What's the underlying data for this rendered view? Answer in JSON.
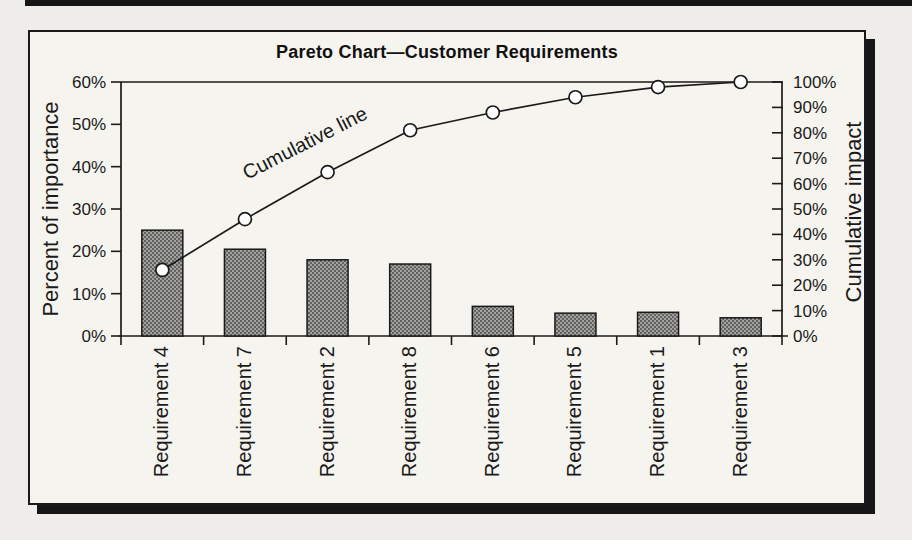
{
  "page": {
    "background": "#efede9",
    "canvas_background": "#f6f4ef",
    "rule_color": "#161616",
    "ink": "#1a1a1a",
    "bar_fill_tone": "#8d8b88",
    "marker_fill": "#ffffff"
  },
  "chart_data": {
    "type": "bar",
    "subtype": "pareto-combo-bar-line",
    "title": "Pareto Chart—Customer Requirements",
    "categories": [
      "Requirement 4",
      "Requirement 7",
      "Requirement 2",
      "Requirement 8",
      "Requirement 6",
      "Requirement 5",
      "Requirement 1",
      "Requirement 3"
    ],
    "series": [
      {
        "name": "Percent of importance",
        "type": "bar",
        "axis": "left",
        "values": [
          25,
          20.5,
          18,
          17,
          7,
          5.4,
          5.6,
          4.3
        ]
      },
      {
        "name": "Cumulative line",
        "type": "line",
        "axis": "right",
        "marker": "open-circle",
        "values": [
          26,
          46,
          64.5,
          81,
          88,
          94,
          98,
          100
        ]
      }
    ],
    "left_axis": {
      "label": "Percent of importance",
      "min": 0,
      "max": 60,
      "step": 10,
      "tick_labels": [
        "0%",
        "10%",
        "20%",
        "30%",
        "40%",
        "50%",
        "60%"
      ]
    },
    "right_axis": {
      "label": "Cumulative impact",
      "min": 0,
      "max": 100,
      "step": 10,
      "tick_labels": [
        "0%",
        "10%",
        "20%",
        "30%",
        "40%",
        "50%",
        "60%",
        "70%",
        "80%",
        "90%",
        "100%"
      ]
    },
    "x_axis": {
      "tick_label_rotation_deg": -90
    },
    "annotation": {
      "text": "Cumulative line",
      "rotation_deg": -27
    },
    "legend": "none",
    "grid": "top-frame-line-only"
  }
}
